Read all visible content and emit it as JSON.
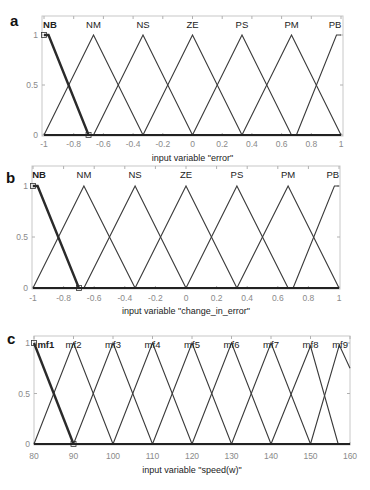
{
  "figure": {
    "panels": [
      "a",
      "b",
      "c"
    ]
  },
  "chart_data": [
    {
      "panel": "a",
      "type": "line",
      "title": "",
      "xlabel": "input variable \"error\"",
      "ylabel": "",
      "xlim": [
        -1,
        1
      ],
      "ylim": [
        0,
        1
      ],
      "xticks": [
        -1,
        -0.8,
        -0.6,
        -0.4,
        -0.2,
        0,
        0.2,
        0.4,
        0.6,
        0.8,
        1
      ],
      "xtick_labels": [
        "-1",
        "-0.8",
        "-0.6",
        "-0.4",
        "-0.2",
        "0",
        "0.2",
        "0.4",
        "0.6",
        "0.8",
        "1"
      ],
      "yticks": [
        0,
        0.5,
        1
      ],
      "ytick_labels": [
        "0",
        "0.5",
        "1"
      ],
      "grid": false,
      "selected_mf": "NB",
      "series": [
        {
          "name": "NB",
          "shape": "trapezoid",
          "points": [
            [
              -1,
              1
            ],
            [
              -0.97,
              1
            ],
            [
              -0.7,
              0
            ]
          ],
          "label_x": -0.96
        },
        {
          "name": "NM",
          "shape": "triangle",
          "points": [
            [
              -1,
              0
            ],
            [
              -0.667,
              1
            ],
            [
              -0.333,
              0
            ]
          ],
          "label_x": -0.667
        },
        {
          "name": "NS",
          "shape": "triangle",
          "points": [
            [
              -0.667,
              0
            ],
            [
              -0.333,
              1
            ],
            [
              0,
              0
            ]
          ],
          "label_x": -0.333
        },
        {
          "name": "ZE",
          "shape": "triangle",
          "points": [
            [
              -0.333,
              0
            ],
            [
              0,
              1
            ],
            [
              0.333,
              0
            ]
          ],
          "label_x": 0
        },
        {
          "name": "PS",
          "shape": "triangle",
          "points": [
            [
              0,
              0
            ],
            [
              0.333,
              1
            ],
            [
              0.667,
              0
            ]
          ],
          "label_x": 0.333
        },
        {
          "name": "PM",
          "shape": "triangle",
          "points": [
            [
              0.333,
              0
            ],
            [
              0.667,
              1
            ],
            [
              1,
              0
            ]
          ],
          "label_x": 0.667
        },
        {
          "name": "PB",
          "shape": "trapezoid",
          "points": [
            [
              0.7,
              0
            ],
            [
              0.97,
              1
            ],
            [
              1,
              1
            ]
          ],
          "label_x": 0.96
        }
      ]
    },
    {
      "panel": "b",
      "type": "line",
      "title": "",
      "xlabel": "input variable \"change_in_error\"",
      "ylabel": "",
      "xlim": [
        -1,
        1
      ],
      "ylim": [
        0,
        1
      ],
      "xticks": [
        -1,
        -0.8,
        -0.6,
        -0.4,
        -0.2,
        0,
        0.2,
        0.4,
        0.6,
        0.8,
        1
      ],
      "xtick_labels": [
        "-1",
        "-0.8",
        "-0.6",
        "-0.4",
        "-0.2",
        "0",
        "0.2",
        "0.4",
        "0.6",
        "0.8",
        "1"
      ],
      "yticks": [
        0,
        0.5,
        1
      ],
      "ytick_labels": [
        "0",
        "0.5",
        "1"
      ],
      "grid": false,
      "selected_mf": "NB",
      "series": [
        {
          "name": "NB",
          "shape": "trapezoid",
          "points": [
            [
              -1,
              1
            ],
            [
              -0.97,
              1
            ],
            [
              -0.7,
              0
            ]
          ],
          "label_x": -0.96
        },
        {
          "name": "NM",
          "shape": "triangle",
          "points": [
            [
              -1,
              0
            ],
            [
              -0.667,
              1
            ],
            [
              -0.333,
              0
            ]
          ],
          "label_x": -0.667
        },
        {
          "name": "NS",
          "shape": "triangle",
          "points": [
            [
              -0.667,
              0
            ],
            [
              -0.333,
              1
            ],
            [
              0,
              0
            ]
          ],
          "label_x": -0.333
        },
        {
          "name": "ZE",
          "shape": "triangle",
          "points": [
            [
              -0.333,
              0
            ],
            [
              0,
              1
            ],
            [
              0.333,
              0
            ]
          ],
          "label_x": 0
        },
        {
          "name": "PS",
          "shape": "triangle",
          "points": [
            [
              0,
              0
            ],
            [
              0.333,
              1
            ],
            [
              0.667,
              0
            ]
          ],
          "label_x": 0.333
        },
        {
          "name": "PM",
          "shape": "triangle",
          "points": [
            [
              0.333,
              0
            ],
            [
              0.667,
              1
            ],
            [
              1,
              0
            ]
          ],
          "label_x": 0.667
        },
        {
          "name": "PB",
          "shape": "trapezoid",
          "points": [
            [
              0.7,
              0
            ],
            [
              0.97,
              1
            ],
            [
              1,
              1
            ]
          ],
          "label_x": 0.96
        }
      ]
    },
    {
      "panel": "c",
      "type": "line",
      "title": "",
      "xlabel": "input variable \"speed(w)\"",
      "ylabel": "",
      "xlim": [
        80,
        160
      ],
      "ylim": [
        0,
        1
      ],
      "xticks": [
        80,
        90,
        100,
        110,
        120,
        130,
        140,
        150,
        160
      ],
      "xtick_labels": [
        "80",
        "90",
        "100",
        "110",
        "120",
        "130",
        "140",
        "150",
        "160"
      ],
      "yticks": [
        0,
        0.5,
        1
      ],
      "ytick_labels": [
        "0",
        "0.5",
        "1"
      ],
      "grid": false,
      "selected_mf": "mf1",
      "series": [
        {
          "name": "mf1",
          "shape": "triangle",
          "points": [
            [
              80,
              1
            ],
            [
              90,
              0
            ]
          ],
          "label_x": 83
        },
        {
          "name": "mf2",
          "shape": "triangle",
          "points": [
            [
              80,
              0
            ],
            [
              90,
              1
            ],
            [
              100,
              0
            ]
          ],
          "label_x": 90
        },
        {
          "name": "mf3",
          "shape": "triangle",
          "points": [
            [
              90,
              0
            ],
            [
              100,
              1
            ],
            [
              110,
              0
            ]
          ],
          "label_x": 100
        },
        {
          "name": "mf4",
          "shape": "triangle",
          "points": [
            [
              100,
              0
            ],
            [
              110,
              1
            ],
            [
              120,
              0
            ]
          ],
          "label_x": 110
        },
        {
          "name": "mf5",
          "shape": "triangle",
          "points": [
            [
              110,
              0
            ],
            [
              120,
              1
            ],
            [
              130,
              0
            ]
          ],
          "label_x": 120
        },
        {
          "name": "mf6",
          "shape": "triangle",
          "points": [
            [
              120,
              0
            ],
            [
              130,
              1
            ],
            [
              140,
              0
            ]
          ],
          "label_x": 130
        },
        {
          "name": "mf7",
          "shape": "triangle",
          "points": [
            [
              130,
              0
            ],
            [
              140,
              1
            ],
            [
              150,
              0
            ]
          ],
          "label_x": 140
        },
        {
          "name": "mf8",
          "shape": "triangle",
          "points": [
            [
              140,
              0
            ],
            [
              150,
              0.97
            ],
            [
              157,
              0
            ]
          ],
          "label_x": 150
        },
        {
          "name": "mf9",
          "shape": "triangle",
          "points": [
            [
              150,
              0
            ],
            [
              157.3,
              0.98
            ],
            [
              160,
              0.75
            ]
          ],
          "label_x": 157.5
        }
      ]
    }
  ]
}
